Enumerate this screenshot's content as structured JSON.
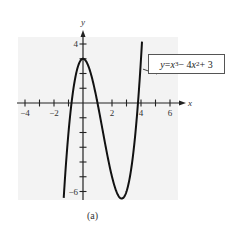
{
  "chart_data": {
    "type": "line",
    "title": "",
    "caption": "(a)",
    "xlabel": "x",
    "ylabel": "y",
    "xlim": [
      -4.4,
      6.5
    ],
    "ylim": [
      -6.5,
      4.5
    ],
    "grid": false,
    "background": "#f3f3f3",
    "x_ticks": [
      -4,
      -3,
      -2,
      -1,
      0,
      1,
      2,
      3,
      4,
      5,
      6
    ],
    "x_tick_labels": [
      {
        "value": -4,
        "label": "−4"
      },
      {
        "value": -2,
        "label": "−2"
      },
      {
        "value": 2,
        "label": "2"
      },
      {
        "value": 4,
        "label": "4"
      },
      {
        "value": 6,
        "label": "6"
      }
    ],
    "y_ticks": [
      -6,
      -5,
      -4,
      -3,
      -2,
      -1,
      1,
      2,
      3,
      4
    ],
    "y_tick_labels": [
      {
        "value": 4,
        "label": "4"
      },
      {
        "value": -6,
        "label": "−6"
      }
    ],
    "series": [
      {
        "name": "y = x³ − 4x² + 3",
        "equation": "x^3 - 4x^2 + 3",
        "x_range": [
          -1.33,
          4.07
        ],
        "key_points": [
          {
            "x": 0,
            "y": 3,
            "note": "local max"
          },
          {
            "x": 2.667,
            "y": -6.48,
            "note": "local min"
          },
          {
            "x": -0.79,
            "y": 0
          },
          {
            "x": 1,
            "y": 0
          },
          {
            "x": 3.79,
            "y": 0
          }
        ],
        "color": "#111111"
      }
    ],
    "annotations": [
      {
        "text": "y = x³ − 4x² + 3",
        "type": "callout-box",
        "points_to": {
          "x": 4.0,
          "y": 2.5
        }
      }
    ]
  },
  "labels": {
    "callout_y": "y",
    "callout_eq": " = ",
    "callout_x1": "x",
    "callout_p1": "3",
    "callout_mid": " − 4",
    "callout_x2": "x",
    "callout_p2": "2",
    "callout_end": " + 3",
    "caption": "(a)"
  }
}
